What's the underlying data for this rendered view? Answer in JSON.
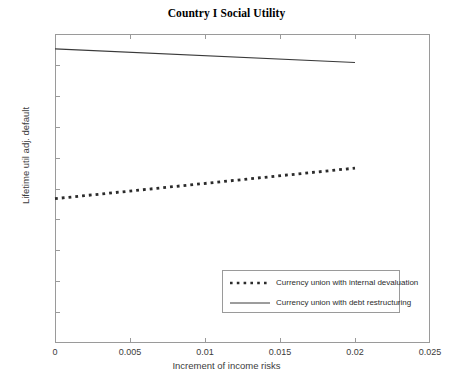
{
  "chart_data": {
    "type": "line",
    "title": "Country I Social Utility",
    "xlabel": "Increment of income risks",
    "ylabel": "Lifetime util adj. default",
    "xlim": [
      0,
      0.025
    ],
    "ylim": [
      3.2,
      3.3
    ],
    "xticks": [
      0,
      0.005,
      0.01,
      0.015,
      0.02,
      0.025
    ],
    "xtick_labels": [
      "0",
      "0.005",
      "0.01",
      "0.015",
      "0.02",
      "0.025"
    ],
    "yticks": [
      3.2,
      3.21,
      3.22,
      3.23,
      3.24,
      3.25,
      3.26,
      3.27,
      3.28,
      3.29,
      3.3
    ],
    "ytick_labels": [
      "3.2",
      "3.21",
      "3.22",
      "3.23",
      "3.24",
      "3.25",
      "3.26",
      "3.27",
      "3.28",
      "3.29",
      "3.3"
    ],
    "grid": false,
    "legend_position": "lower right",
    "series": [
      {
        "name": "Currency union with internal devaluation",
        "style": "dotted",
        "color": "#2b2b2b",
        "x": [
          0,
          0.02
        ],
        "y": [
          3.2467,
          3.2566
        ]
      },
      {
        "name": "Currency union with debt restructuring",
        "style": "solid",
        "color": "#3a3a3a",
        "x": [
          0,
          0.02
        ],
        "y": [
          3.2952,
          3.2908
        ]
      }
    ]
  },
  "legend": {
    "entries": [
      {
        "label": "Currency union with internal devaluation"
      },
      {
        "label": "Currency union with debt restructuring"
      }
    ]
  }
}
